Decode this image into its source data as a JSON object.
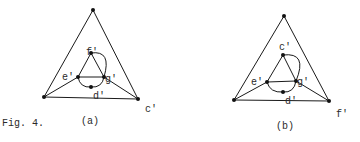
{
  "caption": "Fig. 4.",
  "figures": [
    {
      "id": "a",
      "sublabel": "(a)",
      "outer": {
        "top": [
          93,
          10
        ],
        "left": [
          44,
          97
        ],
        "right": [
          138,
          99
        ]
      },
      "inner": {
        "apex": [
          91,
          53
        ],
        "e": [
          78,
          77
        ],
        "g": [
          104,
          77
        ],
        "d": [
          91,
          87
        ]
      },
      "labels": {
        "apex": "f'",
        "e": "e'",
        "g": "g'",
        "d": "d'",
        "corner": "c'"
      }
    },
    {
      "id": "b",
      "sublabel": "(b)",
      "outer": {
        "top": [
          284,
          16
        ],
        "left": [
          234,
          100
        ],
        "right": [
          329,
          101
        ]
      },
      "inner": {
        "apex": [
          283,
          55
        ],
        "e": [
          267,
          82
        ],
        "g": [
          296,
          81
        ],
        "d": [
          283,
          92
        ]
      },
      "labels": {
        "apex": "c'",
        "e": "e'",
        "g": "g'",
        "d": "d'",
        "corner": "f'"
      }
    }
  ],
  "colors": {
    "ink": "#111111",
    "background": "#ffffff"
  }
}
